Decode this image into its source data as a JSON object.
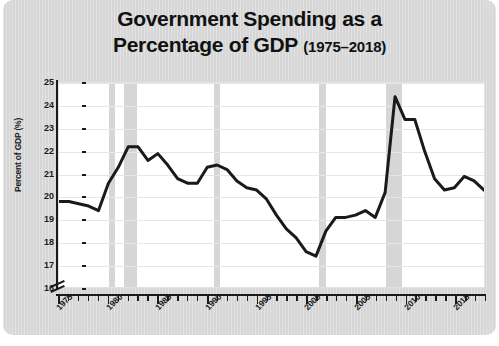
{
  "figure": {
    "background_color": "#ffffff",
    "card_color": "#d9d9d9",
    "plot_background": "#ffffff"
  },
  "title": {
    "line1": "Government Spending as a",
    "line2_main": "Percentage of GDP ",
    "line2_range": "(1975–2018)"
  },
  "chart_data": {
    "type": "line",
    "title": "Government Spending as a Percentage of GDP (1975–2018)",
    "xlabel": "",
    "ylabel": "Percent of GDP (%)",
    "xlim": [
      1975,
      2018
    ],
    "ylim": [
      16,
      25
    ],
    "y_axis_break": true,
    "grid": true,
    "legend_position": "none",
    "line_color": "#1a1a1a",
    "line_width": 3,
    "yticks": [
      16,
      17,
      18,
      19,
      20,
      21,
      22,
      23,
      24,
      25
    ],
    "ytick_labels": [
      "16",
      "17",
      "18",
      "19",
      "20",
      "21",
      "22",
      "23",
      "24",
      "25"
    ],
    "xticks": [
      1975,
      1980,
      1985,
      1990,
      1995,
      2000,
      2005,
      2010,
      2015
    ],
    "xtick_labels": [
      "1975",
      "1980",
      "1985",
      "1990",
      "1995",
      "2000",
      "2005",
      "2010",
      "2015"
    ],
    "x_minor_tick_step": 1,
    "x": [
      1975,
      1976,
      1977,
      1978,
      1979,
      1980,
      1981,
      1982,
      1983,
      1984,
      1985,
      1986,
      1987,
      1988,
      1989,
      1990,
      1991,
      1992,
      1993,
      1994,
      1995,
      1996,
      1997,
      1998,
      1999,
      2000,
      2001,
      2002,
      2003,
      2004,
      2005,
      2006,
      2007,
      2008,
      2009,
      2010,
      2011,
      2012,
      2013,
      2014,
      2015,
      2016,
      2017,
      2018
    ],
    "values": [
      19.8,
      19.8,
      19.7,
      19.6,
      19.4,
      20.6,
      21.3,
      22.2,
      22.2,
      21.6,
      21.9,
      21.4,
      20.8,
      20.6,
      20.6,
      21.3,
      21.4,
      21.2,
      20.7,
      20.4,
      20.3,
      19.9,
      19.2,
      18.6,
      18.2,
      17.6,
      17.4,
      18.5,
      19.1,
      19.1,
      19.2,
      19.4,
      19.1,
      20.2,
      24.4,
      23.4,
      23.4,
      22.0,
      20.8,
      20.3,
      20.4,
      20.9,
      20.7,
      20.3
    ],
    "shaded_regions": [
      {
        "label": "recession",
        "start": 1980.0,
        "end": 1980.6,
        "color": "#cfcfcf"
      },
      {
        "label": "recession",
        "start": 1981.5,
        "end": 1982.9,
        "color": "#cfcfcf"
      },
      {
        "label": "recession",
        "start": 1990.6,
        "end": 1991.2,
        "color": "#cfcfcf"
      },
      {
        "label": "recession",
        "start": 2001.2,
        "end": 2001.9,
        "color": "#cfcfcf"
      },
      {
        "label": "recession",
        "start": 2007.9,
        "end": 2009.5,
        "color": "#cfcfcf"
      }
    ],
    "annotations": [
      {
        "text": "peak",
        "x": 2009,
        "y": 24.4
      },
      {
        "text": "trough",
        "x": 2000,
        "y": 17.4
      }
    ]
  }
}
